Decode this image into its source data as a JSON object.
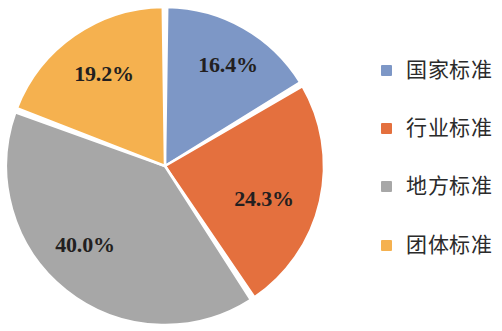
{
  "chart_data": {
    "type": "pie",
    "title": "",
    "subtitle": "",
    "xlabel": "",
    "ylabel": "",
    "legend_position": "right",
    "grid": false,
    "start_angle_deg": 0,
    "direction": "clockwise",
    "categories": [
      "国家标准",
      "行业标准",
      "地方标准",
      "团体标准"
    ],
    "values": [
      16.4,
      24.3,
      40.0,
      19.2
    ],
    "value_unit": "%",
    "data_labels": [
      "16.4%",
      "24.3%",
      "40.0%",
      "19.2%"
    ],
    "colors": [
      "#7D97C6",
      "#E4703E",
      "#A7A7A7",
      "#F5B14F"
    ],
    "slices": [
      {
        "label": "国家标准",
        "value": 16.4,
        "data_label": "16.4%",
        "color": "#7D97C6",
        "start_deg": 0.0,
        "end_deg": 59.04,
        "label_x": 228,
        "label_y": 72
      },
      {
        "label": "行业标准",
        "value": 24.3,
        "data_label": "24.3%",
        "color": "#E4703E",
        "start_deg": 59.04,
        "end_deg": 146.52,
        "label_x": 264,
        "label_y": 206
      },
      {
        "label": "地方标准",
        "value": 40.0,
        "data_label": "40.0%",
        "color": "#A7A7A7",
        "start_deg": 146.52,
        "end_deg": 290.52,
        "label_x": 85,
        "label_y": 252
      },
      {
        "label": "团体标准",
        "value": 19.2,
        "data_label": "19.2%",
        "color": "#F5B14F",
        "start_deg": 290.52,
        "end_deg": 360.0,
        "label_x": 104,
        "label_y": 81
      }
    ]
  },
  "legend": {
    "items": [
      {
        "label": "国家标准",
        "color": "#7D97C6",
        "top": 10
      },
      {
        "label": "行业标准",
        "color": "#E4703E",
        "top": 68
      },
      {
        "label": "地方标准",
        "color": "#A7A7A7",
        "top": 126
      },
      {
        "label": "团体标准",
        "color": "#F5B14F",
        "top": 185
      }
    ]
  },
  "geometry": {
    "center_x": 165,
    "center_y": 166,
    "radius": 159,
    "gap_deg": 1.6,
    "background": "#ffffff"
  }
}
